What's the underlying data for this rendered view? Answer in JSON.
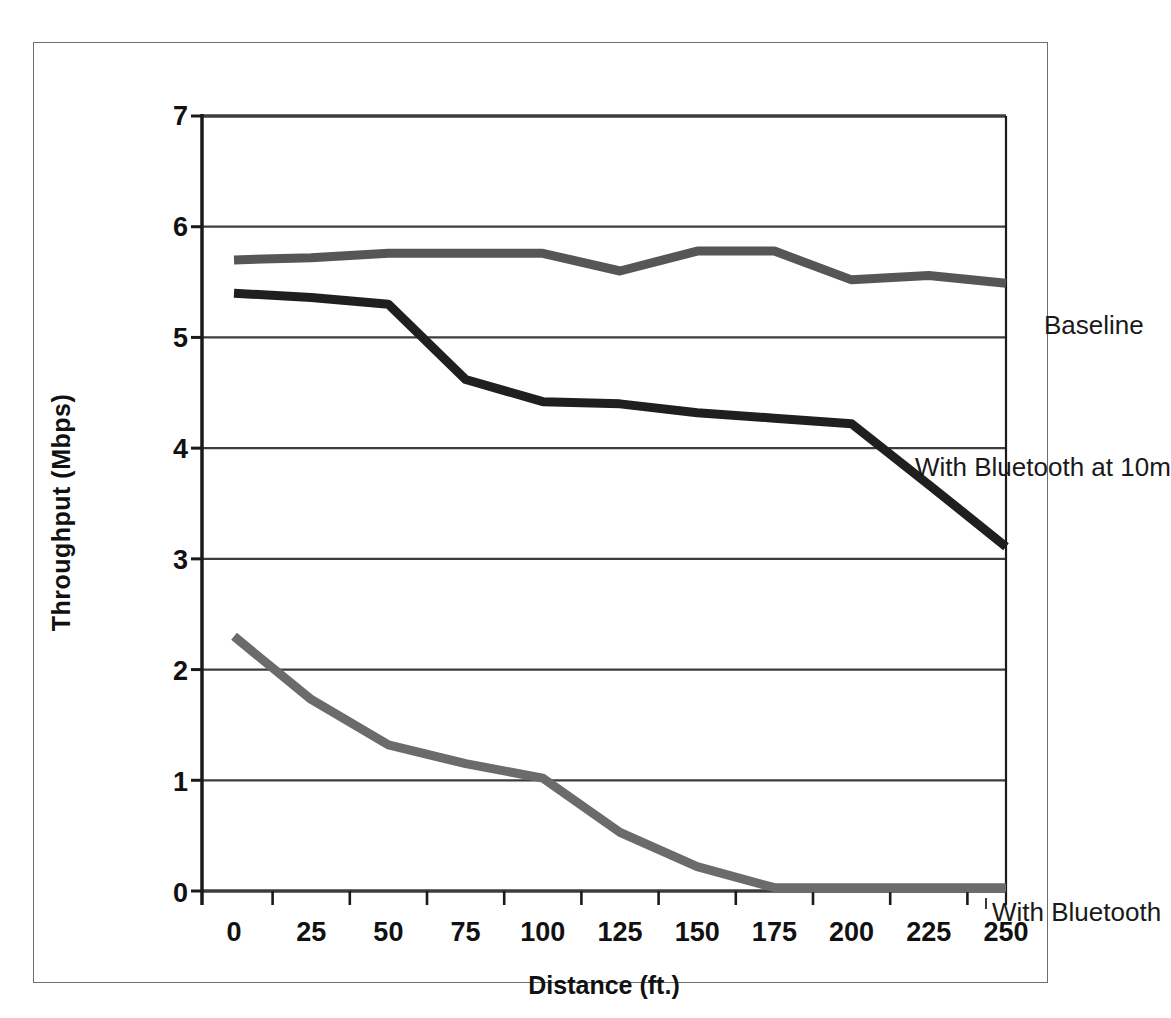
{
  "chart_data": {
    "type": "line",
    "title": "",
    "xlabel": "Distance (ft.)",
    "ylabel": "Throughput (Mbps)",
    "x": [
      0,
      25,
      50,
      75,
      100,
      125,
      150,
      175,
      200,
      225,
      250
    ],
    "categories": [
      "0",
      "25",
      "50",
      "75",
      "100",
      "125",
      "150",
      "175",
      "200",
      "225",
      "250"
    ],
    "xlim": [
      0,
      250
    ],
    "ylim": [
      0,
      7
    ],
    "yticks": [
      0,
      1,
      2,
      3,
      4,
      5,
      6,
      7
    ],
    "ytick_labels": [
      "0",
      "1",
      "2",
      "3",
      "4",
      "5",
      "6",
      "7"
    ],
    "grid": true,
    "grid_axis": "y",
    "legend": "inline-annotations",
    "series": [
      {
        "name": "Baseline",
        "color": "#565656",
        "values": [
          5.7,
          5.72,
          5.76,
          5.76,
          5.76,
          5.6,
          5.78,
          5.78,
          5.52,
          5.56,
          5.49
        ]
      },
      {
        "name": "With Bluetooth at 10m",
        "color": "#1f1f1f",
        "values": [
          5.4,
          5.36,
          5.3,
          4.62,
          4.42,
          4.4,
          4.32,
          4.27,
          4.22,
          3.67,
          3.11
        ]
      },
      {
        "name": "With Bluetooth",
        "color": "#6b6b6b",
        "values": [
          2.3,
          1.73,
          1.32,
          1.15,
          1.02,
          0.53,
          0.22,
          0.03,
          0.03,
          0.03,
          0.03
        ]
      }
    ]
  },
  "axes": {
    "y_title": "Throughput (Mbps)",
    "x_title": "Distance (ft.)",
    "y_tick_labels": [
      "7",
      "6",
      "5",
      "4",
      "3",
      "2",
      "1",
      "0"
    ],
    "x_tick_labels": [
      "0",
      "25",
      "50",
      "75",
      "100",
      "125",
      "150",
      "175",
      "200",
      "225",
      "250"
    ]
  },
  "annotations": {
    "baseline": "Baseline",
    "bluetooth_10m": "With Bluetooth at 10m",
    "bluetooth": "With Bluetooth"
  },
  "colors": {
    "baseline": "#565656",
    "bluetooth_10m": "#1f1f1f",
    "bluetooth": "#6b6b6b",
    "axis": "#1a1a1a",
    "grid": "#3d3d3d",
    "frame": "#6e6e6e",
    "background": "#ffffff"
  }
}
